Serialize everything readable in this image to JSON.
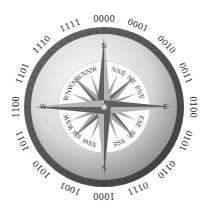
{
  "diagram": {
    "type": "compass-rose",
    "center": [
      104,
      107
    ],
    "colors": {
      "background": "#ffffff",
      "outer_ring": "#5a5a5a",
      "outer_ring_edge": "#3a3a3a",
      "bevel_light": "#f2f2f2",
      "bevel_dark": "#9a9a9a",
      "inner_disk": "#ffffff",
      "star_light": "#b8b8b8",
      "star_dark": "#6e6e6e",
      "text": "#222222"
    },
    "binary_labels": [
      "0000",
      "0001",
      "0010",
      "0011",
      "0100",
      "0101",
      "0110",
      "0111",
      "1000",
      "1001",
      "1010",
      "1011",
      "1100",
      "1101",
      "1110",
      "1111"
    ],
    "cardinal_labels": [
      "N",
      "E",
      "S",
      "W"
    ],
    "intercardinal_labels": [
      "NNE",
      "NE",
      "ENE",
      "ESE",
      "SE",
      "SSE",
      "SSW",
      "SW",
      "WSW",
      "WNW",
      "NW",
      "NNW"
    ]
  }
}
